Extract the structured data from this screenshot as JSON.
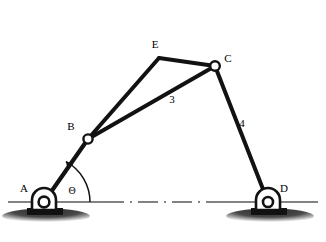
{
  "figure": {
    "type": "kinematic-linkage-diagram",
    "background_color": "#ffffff",
    "ink_color": "#111111",
    "ground_line_color": "#555555"
  },
  "joints": [
    {
      "id": "A",
      "label": "A",
      "x": 44,
      "y": 202,
      "kind": "fixed-pivot",
      "label_x": 24,
      "label_y": 192
    },
    {
      "id": "B",
      "label": "B",
      "x": 88,
      "y": 139,
      "kind": "moving-pin",
      "label_x": 71,
      "label_y": 130
    },
    {
      "id": "C",
      "label": "C",
      "x": 215,
      "y": 66,
      "kind": "moving-pin",
      "label_x": 228,
      "label_y": 62
    },
    {
      "id": "D",
      "label": "D",
      "x": 268,
      "y": 202,
      "kind": "fixed-pivot",
      "label_x": 284,
      "label_y": 192
    },
    {
      "id": "E",
      "label": "E",
      "x": 159,
      "y": 58,
      "kind": "rigid-vertex",
      "label_x": 155,
      "label_y": 48
    }
  ],
  "links": [
    {
      "id": "link-2",
      "from": "A",
      "to": "B",
      "number_label": null
    },
    {
      "id": "link-3-lower-chord",
      "from": "B",
      "to": "C",
      "number_label": "3",
      "label_x": 172,
      "label_y": 103
    },
    {
      "id": "link-3-upper-chord-be",
      "from": "B",
      "to": "E",
      "number_label": null
    },
    {
      "id": "link-3-upper-chord-ec",
      "from": "E",
      "to": "C",
      "number_label": null
    },
    {
      "id": "link-4",
      "from": "C",
      "to": "D",
      "number_label": "4",
      "label_x": 242,
      "label_y": 127
    }
  ],
  "angle": {
    "id": "theta",
    "symbol": "Θ",
    "label_x": 72,
    "label_y": 194,
    "vertex": "A",
    "from_ray": "ground-horizontal",
    "to_ray": "link-AB",
    "arc_radius": 46
  },
  "ground": {
    "line_style": "dash-dot-centerline",
    "baseline_y": 202,
    "left_segment": {
      "x1": 8,
      "x2": 104
    },
    "right_segment": {
      "x1": 210,
      "x2": 318
    },
    "center_dash_dot": {
      "x1": 104,
      "x2": 210
    },
    "supports": [
      {
        "at": "A",
        "hatch": true
      },
      {
        "at": "D",
        "hatch": true
      }
    ]
  }
}
